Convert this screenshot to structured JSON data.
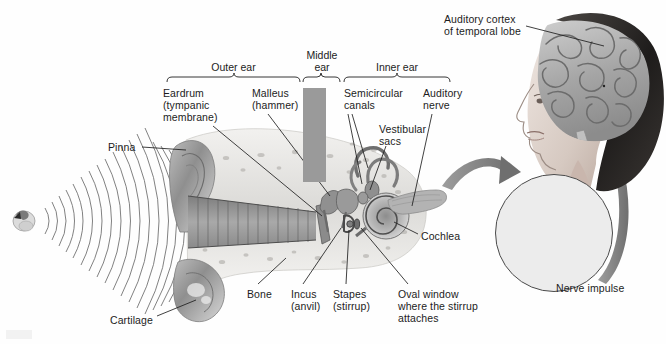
{
  "figure": {
    "domain": "anatomical-diagram",
    "background_color": "#fefefe",
    "ink_color": "#1c1c1c",
    "accent_gray": "#9a9a9a"
  },
  "section_brackets": [
    {
      "id": "outer-ear",
      "label": "Outer ear",
      "x": 167,
      "width": 133
    },
    {
      "id": "middle-ear",
      "label": "Middle\near",
      "x": 303,
      "width": 37
    },
    {
      "id": "inner-ear",
      "label": "Inner ear",
      "x": 344,
      "width": 106
    }
  ],
  "labels": [
    {
      "id": "eardrum",
      "text": "Eardrum\n(tympanic\nmembrane)",
      "x": 163,
      "y": 88,
      "align": "left"
    },
    {
      "id": "malleus",
      "text": "Malleus\n(hammer)",
      "x": 252,
      "y": 88,
      "align": "left"
    },
    {
      "id": "semicircular",
      "text": "Semicircular\ncanals",
      "x": 344,
      "y": 88,
      "align": "left"
    },
    {
      "id": "vestibular",
      "text": "Vestibular\nsacs",
      "x": 379,
      "y": 124,
      "align": "left"
    },
    {
      "id": "auditory-nerve",
      "text": "Auditory\nnerve",
      "x": 423,
      "y": 88,
      "align": "left"
    },
    {
      "id": "pinna",
      "text": "Pinna",
      "x": 108,
      "y": 142,
      "align": "left"
    },
    {
      "id": "cochlea",
      "text": "Cochlea",
      "x": 421,
      "y": 231,
      "align": "left"
    },
    {
      "id": "bone",
      "text": "Bone",
      "x": 247,
      "y": 289,
      "align": "left"
    },
    {
      "id": "incus",
      "text": "Incus\n(anvil)",
      "x": 291,
      "y": 289,
      "align": "left"
    },
    {
      "id": "stapes",
      "text": "Stapes\n(stirrup)",
      "x": 333,
      "y": 289,
      "align": "left"
    },
    {
      "id": "oval-window",
      "text": "Oval window\nwhere the stirrup\nattaches",
      "x": 398,
      "y": 289,
      "align": "left"
    },
    {
      "id": "cartilage",
      "text": "Cartilage",
      "x": 110,
      "y": 315,
      "align": "left"
    },
    {
      "id": "auditory-cortex",
      "text": "Auditory cortex\nof temporal lobe",
      "x": 444,
      "y": 14,
      "align": "left"
    },
    {
      "id": "nerve-impulse",
      "text": "Nerve impulse",
      "x": 556,
      "y": 283,
      "align": "left"
    }
  ],
  "nerve_impulse": {
    "caption": "Nerve impulse",
    "circle": {
      "cx": 553,
      "cy": 232,
      "r": 58
    },
    "trace_baseline_y": 213,
    "spike_pattern": "sparse-spikes-then-dense-bursts"
  },
  "sound_waves": {
    "source_x": 22,
    "source_y": 220,
    "arc_count": 22,
    "description": "concentric sound wave arcs travelling right into the pinna"
  },
  "arrows": [
    {
      "id": "ear-to-impulse",
      "from": "inner-ear",
      "to": "nerve-impulse-circle",
      "direction": "right"
    },
    {
      "id": "impulse-to-brain",
      "from": "nerve-impulse-circle",
      "to": "head-brain",
      "direction": "up"
    }
  ],
  "head_illustration": {
    "id": "head-profile-with-brain",
    "description": "grayscale profile of a woman's head showing the brain and auditory cortex"
  }
}
